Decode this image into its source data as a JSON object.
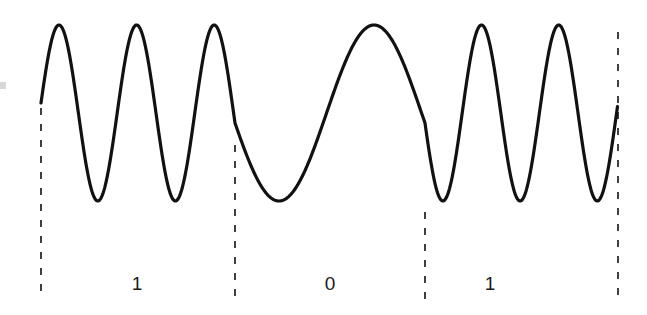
{
  "figure": {
    "kind": "fsk-waveform-diagram",
    "title": "",
    "background_color": "#ffffff",
    "width": 647,
    "height": 315
  },
  "waveform": {
    "stroke_color": "#111111",
    "stroke_width": 3.2,
    "center_y": 113,
    "amplitude": 88,
    "start_x": 41,
    "end_x": 618,
    "start_y": 103,
    "end_y": 30
  },
  "boundaries": {
    "color": "#2b2b2b",
    "width": 1.8,
    "dash": "7 9",
    "lines": [
      {
        "name": "boundary-0",
        "x": 41,
        "y_top": 108,
        "y_bottom": 300
      },
      {
        "name": "boundary-1",
        "x": 235,
        "y_top": 145,
        "y_bottom": 300
      },
      {
        "name": "boundary-2",
        "x": 425,
        "y_top": 212,
        "y_bottom": 300
      },
      {
        "name": "boundary-3",
        "x": 618,
        "y_top": 32,
        "y_bottom": 300
      }
    ]
  },
  "bit_labels": [
    {
      "text": "1",
      "x": 137,
      "y": 284
    },
    {
      "text": "0",
      "x": 330,
      "y": 284
    },
    {
      "text": "1",
      "x": 490,
      "y": 284
    }
  ],
  "chart_data": {
    "type": "line",
    "title": "",
    "xlabel": "",
    "ylabel": "",
    "grid": false,
    "legend": null,
    "axes_visible": false,
    "bit_sequence": [
      "1",
      "0",
      "1"
    ],
    "segments": [
      {
        "bit": "1",
        "x_start": 41,
        "x_end": 235,
        "cycles": 2.5,
        "frequency": "high",
        "peaks_x": [
          63,
          135,
          212
        ],
        "troughs_x": [
          100,
          175
        ]
      },
      {
        "bit": "0",
        "x_start": 235,
        "x_end": 425,
        "cycles": 1.0,
        "frequency": "low",
        "peaks_x": [
          340
        ],
        "troughs_x": [
          267,
          424
        ]
      },
      {
        "bit": "1",
        "x_start": 425,
        "x_end": 618,
        "cycles": 2.5,
        "frequency": "high",
        "peaks_x": [
          465,
          543,
          618
        ],
        "troughs_x": [
          505,
          580
        ]
      }
    ],
    "ylim": [
      -1,
      1
    ],
    "xlim": [
      41,
      618
    ],
    "amplitude": 1.0,
    "tick_labels_x": [
      "1",
      "0",
      "1"
    ],
    "tick_labels_y": []
  }
}
